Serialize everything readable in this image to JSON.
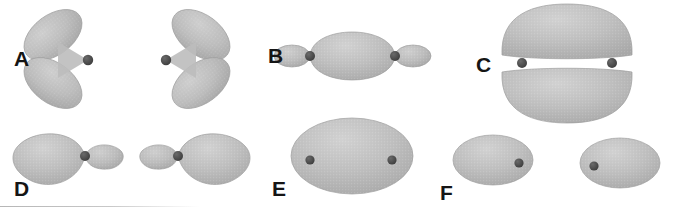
{
  "figure": {
    "width": 675,
    "height": 214,
    "background_color": "#ffffff",
    "lobe_fill_color": "#b9b9b9",
    "lobe_edge_color": "#9a9a9a",
    "nucleus_color": "#4a4a4a",
    "label_color": "#151515"
  },
  "panels": [
    {
      "id": "A",
      "label": "A",
      "label_x": 14,
      "label_y": 36,
      "description": "bent two-lobe orbital pair, lobes angled up and down meeting at one nucleus",
      "units": [
        {
          "name": "unit-a-left",
          "mirrored": false,
          "nucleus": {
            "cx": 88,
            "cy": 60,
            "r": 5.2
          },
          "lobes": [
            {
              "name": "upper-lobe",
              "cx": 53,
              "cy": 35,
              "rx": 33,
              "ry": 20,
              "rotate": -37
            },
            {
              "name": "lower-lobe",
              "cx": 53,
              "cy": 83,
              "rx": 33,
              "ry": 20,
              "rotate": 37
            }
          ]
        },
        {
          "name": "unit-a-right",
          "mirrored": true,
          "nucleus": {
            "cx": 166,
            "cy": 60,
            "r": 5.2
          },
          "lobes": [
            {
              "name": "upper-lobe",
              "cx": 201,
              "cy": 35,
              "rx": 33,
              "ry": 20,
              "rotate": 37
            },
            {
              "name": "lower-lobe",
              "cx": 201,
              "cy": 83,
              "rx": 33,
              "ry": 20,
              "rotate": -37
            }
          ]
        }
      ]
    },
    {
      "id": "B",
      "label": "B",
      "label_x": 268,
      "label_y": 45,
      "description": "large central sigma lens between two nuclei with small outer lobes",
      "units": [
        {
          "name": "unit-b",
          "nucleus_left": {
            "cx": 310,
            "cy": 56,
            "r": 5.0
          },
          "nucleus_right": {
            "cx": 395,
            "cy": 56,
            "r": 5.0
          },
          "central_lens": {
            "cx": 352,
            "cy": 56,
            "rx": 46,
            "ry": 33
          },
          "outer_lobe_left": {
            "cx": 292,
            "cy": 56,
            "rx": 18,
            "ry": 11
          },
          "outer_lobe_right": {
            "cx": 413,
            "cy": 56,
            "rx": 18,
            "ry": 11
          }
        }
      ]
    },
    {
      "id": "C",
      "label": "C",
      "label_x": 476,
      "label_y": 54,
      "description": "pi bonding orbital, two flattened domes above and below the internuclear axis",
      "units": [
        {
          "name": "unit-c",
          "nucleus_left": {
            "cx": 522,
            "cy": 63,
            "r": 5.0
          },
          "nucleus_right": {
            "cx": 612,
            "cy": 63,
            "r": 5.0
          },
          "upper_dome": {
            "cx": 567,
            "cy": 33,
            "rx": 67,
            "ry": 27
          },
          "lower_dome": {
            "cx": 567,
            "cy": 94,
            "rx": 67,
            "ry": 27
          }
        }
      ]
    },
    {
      "id": "D",
      "label": "D",
      "label_x": 14,
      "label_y": 178,
      "description": "asymmetric polarized orbital pair, large lobe on one side and small lobe opposite",
      "units": [
        {
          "name": "unit-d-left",
          "mirrored": false,
          "nucleus": {
            "cx": 85,
            "cy": 156,
            "r": 5.0
          },
          "large_lobe": {
            "cx": 50,
            "cy": 156,
            "rx": 37,
            "ry": 22
          },
          "small_lobe": {
            "cx": 105,
            "cy": 156,
            "rx": 20,
            "ry": 12
          }
        },
        {
          "name": "unit-d-right",
          "mirrored": true,
          "nucleus": {
            "cx": 178,
            "cy": 156,
            "r": 5.0
          },
          "large_lobe": {
            "cx": 213,
            "cy": 156,
            "rx": 37,
            "ry": 22
          },
          "small_lobe": {
            "cx": 158,
            "cy": 156,
            "rx": 20,
            "ry": 12
          }
        }
      ]
    },
    {
      "id": "E",
      "label": "E",
      "label_x": 272,
      "label_y": 178,
      "description": "single large delocalized ellipse enclosing both nuclei",
      "units": [
        {
          "name": "unit-e",
          "ellipse": {
            "cx": 352,
            "cy": 156,
            "rx": 61,
            "ry": 38
          },
          "nucleus_left": {
            "cx": 310,
            "cy": 160,
            "r": 4.6
          },
          "nucleus_right": {
            "cx": 392,
            "cy": 160,
            "r": 4.6
          }
        }
      ]
    },
    {
      "id": "F",
      "label": "F",
      "label_x": 440,
      "label_y": 182,
      "description": "lone-pair ellipses each offset from its single nucleus",
      "units": [
        {
          "name": "unit-f-left",
          "mirrored": false,
          "ellipse": {
            "cx": 493,
            "cy": 160,
            "rx": 40,
            "ry": 25
          },
          "nucleus": {
            "cx": 519,
            "cy": 163,
            "r": 4.6
          }
        },
        {
          "name": "unit-f-right",
          "mirrored": true,
          "ellipse": {
            "cx": 620,
            "cy": 163,
            "rx": 40,
            "ry": 25
          },
          "nucleus": {
            "cx": 594,
            "cy": 166,
            "r": 4.6
          }
        }
      ]
    }
  ],
  "baseline_rule": {
    "name": "footer-rule",
    "x": 0,
    "y": 206,
    "width": 200
  }
}
